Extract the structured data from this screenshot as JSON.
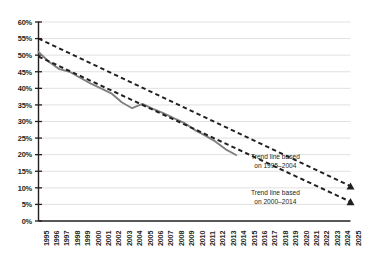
{
  "chart_data": {
    "type": "line",
    "title": "",
    "subtitle": "",
    "xlabel": "",
    "ylabel": "",
    "grid": true,
    "legend": "none",
    "xlim": [
      1995,
      2025
    ],
    "ylim": [
      0,
      60
    ],
    "ytick_labels": [
      "0%",
      "5%",
      "10%",
      "15%",
      "20%",
      "25%",
      "30%",
      "35%",
      "40%",
      "45%",
      "50%",
      "55%",
      "60%"
    ],
    "ytick_values": [
      0,
      5,
      10,
      15,
      20,
      25,
      30,
      35,
      40,
      45,
      50,
      55,
      60
    ],
    "xtick_labels": [
      "1995",
      "1996",
      "1997",
      "1998",
      "1999",
      "2000",
      "2001",
      "2002",
      "2003",
      "2004",
      "2005",
      "2006",
      "2007",
      "2008",
      "2009",
      "2010",
      "2011",
      "2012",
      "2013",
      "2014",
      "2015",
      "2016",
      "2017",
      "2018",
      "2019",
      "2020",
      "2021",
      "2022",
      "2023",
      "2024",
      "2025"
    ],
    "x": [
      1995,
      1996,
      1997,
      1998,
      1999,
      2000,
      2001,
      2002,
      2003,
      2004,
      2005,
      2006,
      2007,
      2008,
      2009,
      2010,
      2011,
      2012,
      2013,
      2014
    ],
    "series": [
      {
        "name": "Observed",
        "style": "solid",
        "color": "#808080",
        "values": [
          51.0,
          48.0,
          45.8,
          45.0,
          43.2,
          41.5,
          40.0,
          38.5,
          35.8,
          34.0,
          35.3,
          33.8,
          32.5,
          31.0,
          29.6,
          27.5,
          25.8,
          24.0,
          21.6,
          19.9
        ]
      },
      {
        "name": "Trend line based on 1995-2004",
        "style": "dashed",
        "color": "#231f20",
        "endpoint_marker": "triangle",
        "x_start": 1995,
        "y_start": 55.0,
        "x_end": 2025,
        "y_end": 10.5
      },
      {
        "name": "Trend line based on 2000-2014",
        "style": "dashed",
        "color": "#231f20",
        "endpoint_marker": "triangle",
        "x_start": 1995,
        "y_start": 49.6,
        "x_end": 2025,
        "y_end": 5.8
      }
    ],
    "annotations": [
      {
        "name": "trend-label-1995-2004",
        "line1": "Trend line based",
        "line2": "on 1995–2004",
        "x": 2018.6,
        "y": 18.5
      },
      {
        "name": "trend-label-2000-2014",
        "line1": "Trend line based",
        "line2": "on 2000–2014",
        "x": 2018.6,
        "y": 7.6
      }
    ]
  }
}
